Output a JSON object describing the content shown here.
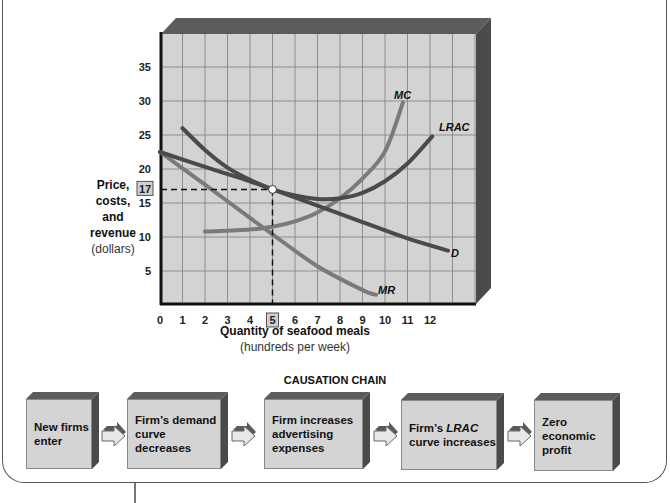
{
  "chart_data": {
    "type": "line",
    "title": "",
    "xlabel": "Quantity of seafood meals",
    "xlabel_unit": "(hundreds per week)",
    "ylabel": "Price, costs, and revenue",
    "ylabel_unit": "(dollars)",
    "xlim": [
      0,
      13
    ],
    "ylim": [
      0,
      38
    ],
    "x_ticks": [
      0,
      1,
      2,
      3,
      4,
      5,
      6,
      7,
      8,
      9,
      10,
      11,
      12
    ],
    "y_ticks": [
      5,
      10,
      15,
      20,
      25,
      30,
      35
    ],
    "grid": true,
    "highlighted_x": 5,
    "highlighted_y": 17,
    "equilibrium_point": {
      "x": 5,
      "y": 17
    },
    "series": [
      {
        "name": "D",
        "color": "#4a4a4a",
        "points": [
          [
            0,
            22.5
          ],
          [
            2,
            20.3
          ],
          [
            4,
            18.2
          ],
          [
            5,
            17
          ],
          [
            7,
            14.6
          ],
          [
            9,
            12.2
          ],
          [
            11,
            9.8
          ],
          [
            12.8,
            8
          ]
        ]
      },
      {
        "name": "MR",
        "color": "#7a7a7a",
        "points": [
          [
            0,
            22.5
          ],
          [
            2,
            17.7
          ],
          [
            4,
            12.8
          ],
          [
            5,
            10.4
          ],
          [
            7,
            5.7
          ],
          [
            9,
            2.2
          ],
          [
            9.6,
            1.5
          ]
        ]
      },
      {
        "name": "LRAC",
        "color": "#4a4a4a",
        "points": [
          [
            1,
            26
          ],
          [
            2,
            22.8
          ],
          [
            3,
            20.2
          ],
          [
            4,
            18.4
          ],
          [
            5,
            17
          ],
          [
            6,
            16.1
          ],
          [
            7,
            15.6
          ],
          [
            8,
            15.7
          ],
          [
            9,
            16.5
          ],
          [
            10,
            18.2
          ],
          [
            11,
            20.8
          ],
          [
            12.1,
            24.8
          ]
        ]
      },
      {
        "name": "MC",
        "color": "#7a7a7a",
        "points": [
          [
            2,
            10.8
          ],
          [
            4,
            11.1
          ],
          [
            5,
            11.5
          ],
          [
            6,
            12.3
          ],
          [
            7,
            13.6
          ],
          [
            8,
            15.7
          ],
          [
            9,
            18.6
          ],
          [
            10,
            22.6
          ],
          [
            10.8,
            29.8
          ]
        ]
      }
    ],
    "legend_labels": [
      "MC",
      "LRAC",
      "D",
      "MR"
    ]
  },
  "axis": {
    "ylabel_lines": [
      "Price,",
      "costs,",
      "and",
      "revenue"
    ],
    "ylabel_unit": "(dollars)",
    "xlabel": "Quantity of seafood meals",
    "xlabel_unit": "(hundreds per week)",
    "highlight_y_label": "17",
    "highlight_x_label": "5"
  },
  "causation_chain": {
    "title": "CAUSATION CHAIN",
    "steps": [
      {
        "line1": "New firms",
        "line2": "enter",
        "line3": ""
      },
      {
        "line1": "Firm’s demand",
        "line2": "curve decreases",
        "line3": ""
      },
      {
        "line1": "Firm increases",
        "line2": "advertising",
        "line3": "expenses"
      },
      {
        "line1": "Firm’s ",
        "italic": "LRAC",
        "line2": "curve increases",
        "line3": ""
      },
      {
        "line1": "Zero",
        "line2": "economic",
        "line3": "profit"
      }
    ]
  },
  "colors": {
    "plot_bg": "#d3d3d3",
    "grid": "#8e8e8e",
    "bevel_top": "#5c5c5c",
    "bevel_side": "#4a4a4a",
    "dark_curve": "#4a4a4a",
    "light_curve": "#7a7a7a"
  }
}
